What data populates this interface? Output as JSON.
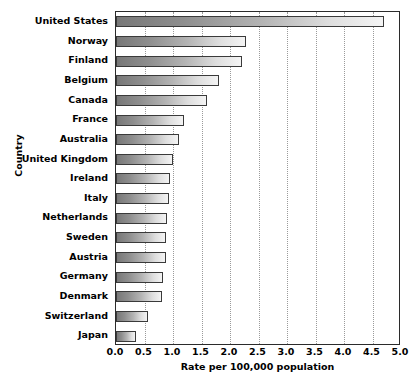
{
  "chart_data": {
    "type": "bar",
    "orientation": "horizontal",
    "title": "",
    "xlabel": "Rate per 100,000 population",
    "ylabel": "Country",
    "xlim": [
      0.0,
      5.0
    ],
    "xticks": [
      "0.0",
      "0.5",
      "1.0",
      "1.5",
      "2.0",
      "2.5",
      "3.0",
      "3.5",
      "4.0",
      "4.5",
      "5.0"
    ],
    "xtick_values": [
      0.0,
      0.5,
      1.0,
      1.5,
      2.0,
      2.5,
      3.0,
      3.5,
      4.0,
      4.5,
      5.0
    ],
    "grid": true,
    "grid_axis": "x",
    "legend": false,
    "categories": [
      "United States",
      "Norway",
      "Finland",
      "Belgium",
      "Canada",
      "France",
      "Australia",
      "United Kingdom",
      "Ireland",
      "Italy",
      "Netherlands",
      "Sweden",
      "Austria",
      "Germany",
      "Denmark",
      "Switzerland",
      "Japan"
    ],
    "values": [
      4.7,
      2.28,
      2.21,
      1.81,
      1.6,
      1.2,
      1.1,
      1.0,
      0.95,
      0.93,
      0.9,
      0.88,
      0.87,
      0.83,
      0.81,
      0.56,
      0.35
    ],
    "bar_style": {
      "gradient_from": "#787878",
      "gradient_to": "#f4f4f4",
      "border_color": "#3a3a3a"
    },
    "axis_color": "#2b2b2b",
    "gridline_color": "#9a9a9a"
  }
}
